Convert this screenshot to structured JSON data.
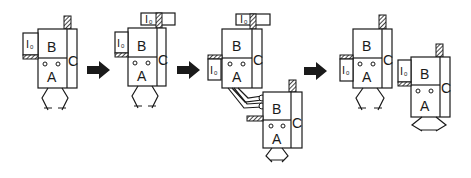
{
  "diagram": {
    "labels": {
      "block_a": "A",
      "block_b": "B",
      "block_c": "C",
      "io_main": "I",
      "io_sub": "0"
    },
    "stages": [
      {
        "id": 1,
        "units": 1,
        "note": "Single unit with I0 attached on left"
      },
      {
        "id": 2,
        "units": 1,
        "note": "Unit with extra I0 block on top"
      },
      {
        "id": 3,
        "units": 2,
        "note": "Unit connected to a second unit via cables"
      },
      {
        "id": 4,
        "units": 2,
        "note": "Two separate units, each with I0"
      }
    ],
    "arrows": 3,
    "colors": {
      "ink": "#1a1a1a",
      "background": "#ffffff"
    }
  }
}
